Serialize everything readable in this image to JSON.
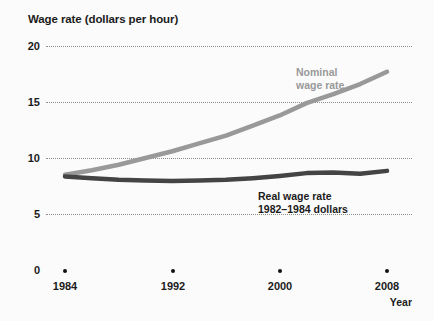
{
  "chart_data": {
    "type": "line",
    "title": "Wage rate (dollars per hour)",
    "xlabel": "Year",
    "ylabel": "Wage rate (dollars per hour)",
    "xlim": [
      1984,
      2008
    ],
    "ylim": [
      0,
      20
    ],
    "yticks": [
      20,
      15,
      10,
      5,
      0
    ],
    "ytick_labels": [
      "20",
      "15",
      "10",
      "5",
      "0"
    ],
    "xticks": [
      1984,
      1992,
      2000,
      2008
    ],
    "xtick_labels": [
      "1984",
      "1992",
      "2000",
      "2008"
    ],
    "grid": "horizontal-dotted",
    "legend": "inline-annotations",
    "x": [
      1984,
      1986,
      1988,
      1990,
      1992,
      1994,
      1996,
      1998,
      2000,
      2002,
      2004,
      2006,
      2008
    ],
    "series": [
      {
        "name": "Nominal wage rate",
        "color": "#999999",
        "label_line1": "Nominal",
        "label_line2": "wage rate",
        "values": [
          8.5,
          8.9,
          9.4,
          10.0,
          10.6,
          11.3,
          12.0,
          12.9,
          13.8,
          14.9,
          15.7,
          16.6,
          17.7
        ]
      },
      {
        "name": "Real wage rate",
        "color": "#444444",
        "label_line1": "Real wage rate",
        "label_line2": "1982–1984 dollars",
        "values": [
          8.35,
          8.2,
          8.05,
          8.0,
          7.95,
          8.0,
          8.05,
          8.2,
          8.4,
          8.65,
          8.7,
          8.6,
          8.85
        ]
      }
    ]
  },
  "axis": {
    "y_labels": [
      "20",
      "15",
      "10",
      "5",
      "0"
    ],
    "x_labels": [
      "1984",
      "1992",
      "2000",
      "2008"
    ],
    "x_axis_title": "Year"
  },
  "annotations": {
    "nominal": {
      "line1": "Nominal",
      "line2": "wage rate"
    },
    "real": {
      "line1": "Real wage rate",
      "line2": "1982–1984 dollars"
    }
  },
  "colors": {
    "nominal": "#999999",
    "real": "#444444",
    "grid": "#8f8f8f",
    "text": "#1b1b1b",
    "background": "#fbfbfb"
  }
}
